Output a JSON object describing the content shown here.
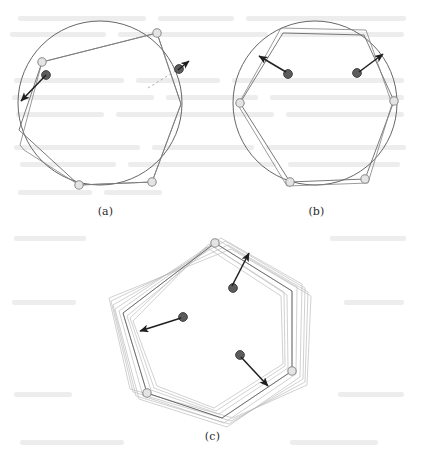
{
  "figure": {
    "width": 422,
    "height": 459,
    "background_color": "#ffffff",
    "colors": {
      "circle_stroke": "#555555",
      "polygon_stroke": "#666666",
      "ghost_polygon_stroke": "#b4b4b4",
      "vertex_open_fill": "#e2e2e2",
      "vertex_open_stroke": "#8c8c8c",
      "vertex_dark_fill": "#5a5a5a",
      "vertex_dark_stroke": "#3a3a3a",
      "arrow_color": "#1f1f1f",
      "dashed_guide": "#999999",
      "caption_color": "#2b2b2b",
      "bleed_text": "#d9d9d9"
    }
  },
  "panels": [
    {
      "id": "a",
      "caption": "(a)",
      "center_x": 100,
      "center_y": 103,
      "radius": 82,
      "rotation_deg": -8,
      "vertices": [
        {
          "name": "v0",
          "x": 157,
          "y": 33,
          "type": "open"
        },
        {
          "name": "v1",
          "x": 180,
          "y": 68,
          "type": "dark"
        },
        {
          "name": "v2",
          "x": 181,
          "y": 104,
          "type": "plain"
        },
        {
          "name": "v3",
          "x": 152,
          "y": 182,
          "type": "open"
        },
        {
          "name": "v4",
          "x": 79,
          "y": 185,
          "type": "open"
        },
        {
          "name": "v5",
          "x": 19,
          "y": 130,
          "type": "plain"
        },
        {
          "name": "v6",
          "x": 42,
          "y": 62,
          "type": "open"
        },
        {
          "name": "v7",
          "x": 46,
          "y": 74,
          "type": "dark"
        }
      ],
      "arrows": [
        {
          "name": "arrow-outward-left",
          "x1": 46,
          "y1": 74,
          "x2": 18,
          "y2": 104
        },
        {
          "name": "arrow-short-right",
          "x1": 180,
          "y1": 68,
          "x2": 188,
          "y2": 62
        }
      ],
      "dashed_guides": [
        {
          "name": "dashed-guide-right",
          "x1": 148,
          "y1": 88,
          "x2": 178,
          "y2": 70
        }
      ]
    },
    {
      "id": "b",
      "caption": "(b)",
      "center_x": 315,
      "center_y": 103,
      "radius": 82,
      "rotation_deg": 0,
      "vertices": [
        {
          "name": "v0",
          "x": 283,
          "y": 33,
          "type": "plain"
        },
        {
          "name": "v1",
          "x": 364,
          "y": 35,
          "type": "plain"
        },
        {
          "name": "v2",
          "x": 394,
          "y": 101,
          "type": "open"
        },
        {
          "name": "v3",
          "x": 365,
          "y": 179,
          "type": "open"
        },
        {
          "name": "v4",
          "x": 290,
          "y": 182,
          "type": "open"
        },
        {
          "name": "v5",
          "x": 240,
          "y": 103,
          "type": "open"
        }
      ],
      "arrows": [
        {
          "name": "arrow-left-inward",
          "x1": 287,
          "y1": 73,
          "x2": 258,
          "y2": 55
        },
        {
          "name": "arrow-right-inward",
          "x1": 358,
          "y1": 73,
          "x2": 384,
          "y2": 53
        }
      ],
      "dashed_guides": []
    },
    {
      "id": "c",
      "caption": "(c)",
      "center_x": 212,
      "center_y": 333,
      "radius": 88,
      "rotation_deg": 0,
      "iteration_count": 9,
      "vertices": [
        {
          "name": "v0",
          "x": 215,
          "y": 243,
          "type": "open"
        },
        {
          "name": "v1",
          "x": 292,
          "y": 291,
          "type": "plain"
        },
        {
          "name": "v2",
          "x": 292,
          "y": 371,
          "type": "open"
        },
        {
          "name": "v3",
          "x": 222,
          "y": 418,
          "type": "plain"
        },
        {
          "name": "v4",
          "x": 147,
          "y": 393,
          "type": "open"
        },
        {
          "name": "v5",
          "x": 123,
          "y": 313,
          "type": "plain"
        }
      ],
      "arrows": [
        {
          "name": "arrow-upper-right",
          "x1": 233,
          "y1": 288,
          "x2": 249,
          "y2": 254
        },
        {
          "name": "arrow-left",
          "x1": 183,
          "y1": 317,
          "x2": 139,
          "y2": 331
        },
        {
          "name": "arrow-lower-right",
          "x1": 240,
          "y1": 355,
          "x2": 268,
          "y2": 385
        }
      ],
      "dashed_guides": []
    }
  ],
  "captions": {
    "a": "(a)",
    "b": "(b)",
    "c": "(c)"
  }
}
